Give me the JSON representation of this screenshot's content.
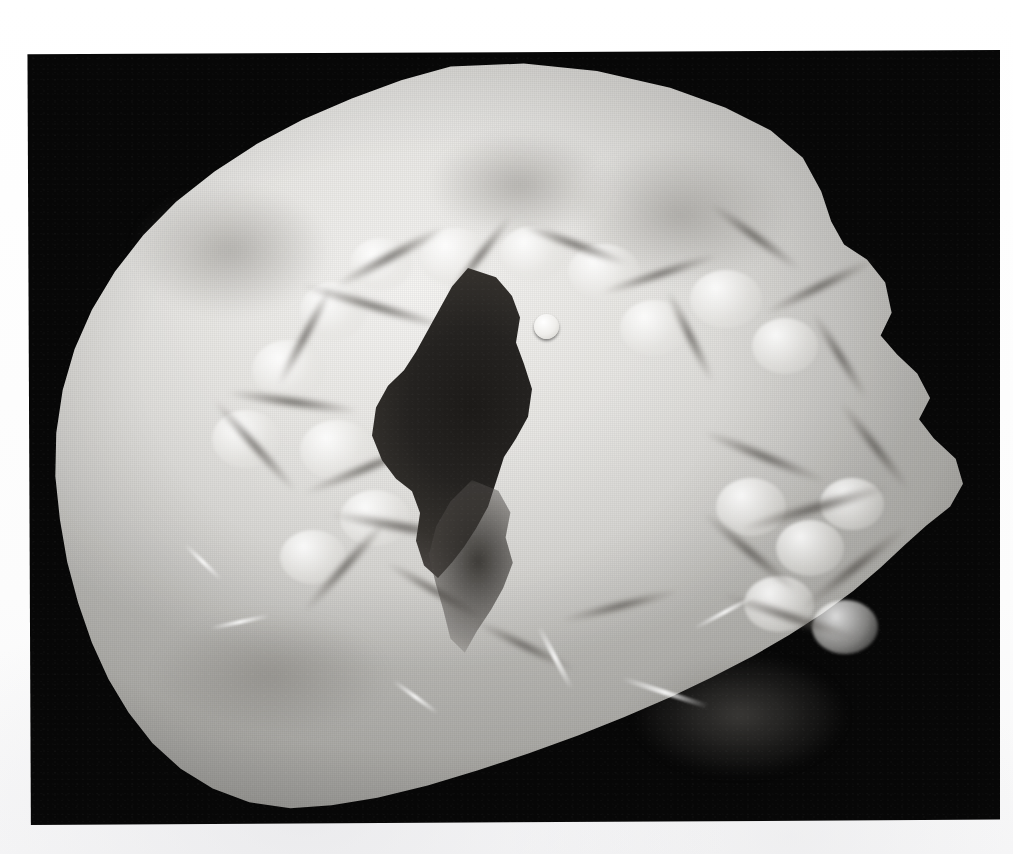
{
  "page": {
    "background_color": "#fdfdfd",
    "width": 1013,
    "height": 854,
    "caption": ""
  },
  "photograph": {
    "kind": "pathology-gross-specimen-photograph",
    "subject": "heart-ventricle-cross-section",
    "description": "Black and white gross pathology photograph of a transversely sectioned heart showing a thickened ventricular wall, prominent trabeculae carneae and a narrowed, slit-like dark ventricular cavity.",
    "plate": {
      "background_color": "#070707",
      "left": 26,
      "top": 50,
      "width": 974,
      "height": 775
    },
    "specimen": {
      "tone_light": "#f0efed",
      "tone_mid": "#d8d7d3",
      "tone_dark": "#bfbeba",
      "outline_shape": "irregular-rounded-blob"
    },
    "cavity": {
      "label": "ventricular-cavity",
      "tone": "#1c1a18",
      "left": 372,
      "top": 268,
      "width": 200,
      "height": 310
    },
    "nodule": {
      "label": "papillary-muscle-cut-surface",
      "tone": "#ffffff",
      "left": 534,
      "top": 314,
      "diameter": 25
    }
  },
  "clefts": [
    {
      "x": 330,
      "y": 250,
      "w": 120,
      "h": 14,
      "r": -28
    },
    {
      "x": 300,
      "y": 300,
      "w": 150,
      "h": 13,
      "r": 16
    },
    {
      "x": 250,
      "y": 330,
      "w": 110,
      "h": 12,
      "r": -62
    },
    {
      "x": 228,
      "y": 395,
      "w": 130,
      "h": 14,
      "r": 8
    },
    {
      "x": 195,
      "y": 440,
      "w": 120,
      "h": 12,
      "r": 48
    },
    {
      "x": 300,
      "y": 460,
      "w": 140,
      "h": 13,
      "r": -22
    },
    {
      "x": 330,
      "y": 520,
      "w": 150,
      "h": 15,
      "r": 10
    },
    {
      "x": 285,
      "y": 560,
      "w": 120,
      "h": 13,
      "r": -48
    },
    {
      "x": 380,
      "y": 585,
      "w": 110,
      "h": 12,
      "r": 30
    },
    {
      "x": 430,
      "y": 250,
      "w": 100,
      "h": 12,
      "r": -52
    },
    {
      "x": 520,
      "y": 238,
      "w": 110,
      "h": 13,
      "r": 20
    },
    {
      "x": 600,
      "y": 268,
      "w": 120,
      "h": 12,
      "r": -18
    },
    {
      "x": 640,
      "y": 330,
      "w": 100,
      "h": 12,
      "r": 64
    },
    {
      "x": 700,
      "y": 230,
      "w": 110,
      "h": 13,
      "r": 36
    },
    {
      "x": 760,
      "y": 280,
      "w": 120,
      "h": 13,
      "r": -26
    },
    {
      "x": 790,
      "y": 350,
      "w": 100,
      "h": 12,
      "r": 58
    },
    {
      "x": 700,
      "y": 450,
      "w": 130,
      "h": 14,
      "r": 22
    },
    {
      "x": 740,
      "y": 500,
      "w": 150,
      "h": 16,
      "r": -16
    },
    {
      "x": 690,
      "y": 545,
      "w": 120,
      "h": 14,
      "r": 40
    },
    {
      "x": 790,
      "y": 560,
      "w": 130,
      "h": 15,
      "r": -38
    },
    {
      "x": 720,
      "y": 610,
      "w": 140,
      "h": 14,
      "r": 18
    },
    {
      "x": 820,
      "y": 440,
      "w": 110,
      "h": 13,
      "r": 52
    },
    {
      "x": 560,
      "y": 600,
      "w": 120,
      "h": 12,
      "r": -14
    },
    {
      "x": 470,
      "y": 640,
      "w": 110,
      "h": 12,
      "r": 26
    }
  ],
  "nodes": [
    {
      "x": 350,
      "y": 238,
      "w": 62,
      "h": 52
    },
    {
      "x": 420,
      "y": 228,
      "w": 70,
      "h": 58
    },
    {
      "x": 500,
      "y": 226,
      "w": 66,
      "h": 54
    },
    {
      "x": 568,
      "y": 244,
      "w": 72,
      "h": 56
    },
    {
      "x": 300,
      "y": 282,
      "w": 66,
      "h": 58
    },
    {
      "x": 252,
      "y": 340,
      "w": 72,
      "h": 60
    },
    {
      "x": 212,
      "y": 410,
      "w": 68,
      "h": 58
    },
    {
      "x": 300,
      "y": 420,
      "w": 74,
      "h": 60
    },
    {
      "x": 340,
      "y": 490,
      "w": 70,
      "h": 56
    },
    {
      "x": 280,
      "y": 530,
      "w": 66,
      "h": 54
    },
    {
      "x": 620,
      "y": 300,
      "w": 68,
      "h": 56
    },
    {
      "x": 690,
      "y": 270,
      "w": 72,
      "h": 58
    },
    {
      "x": 752,
      "y": 318,
      "w": 66,
      "h": 56
    },
    {
      "x": 716,
      "y": 478,
      "w": 70,
      "h": 58
    },
    {
      "x": 776,
      "y": 520,
      "w": 68,
      "h": 56
    },
    {
      "x": 820,
      "y": 478,
      "w": 64,
      "h": 52
    },
    {
      "x": 744,
      "y": 576,
      "w": 70,
      "h": 56
    },
    {
      "x": 812,
      "y": 600,
      "w": 66,
      "h": 54
    }
  ],
  "highlights": [
    {
      "x": 520,
      "y": 655,
      "w": 70,
      "h": 5,
      "r": 62
    },
    {
      "x": 210,
      "y": 620,
      "w": 60,
      "h": 4,
      "r": -12
    },
    {
      "x": 620,
      "y": 690,
      "w": 90,
      "h": 5,
      "r": 18
    },
    {
      "x": 388,
      "y": 695,
      "w": 55,
      "h": 4,
      "r": 36
    },
    {
      "x": 690,
      "y": 610,
      "w": 70,
      "h": 4,
      "r": -28
    },
    {
      "x": 178,
      "y": 560,
      "w": 50,
      "h": 4,
      "r": 44
    }
  ],
  "shades": [
    {
      "x": 120,
      "y": 170,
      "w": 220,
      "h": 160
    },
    {
      "x": 560,
      "y": 130,
      "w": 240,
      "h": 170
    },
    {
      "x": 140,
      "y": 600,
      "w": 260,
      "h": 150
    },
    {
      "x": 620,
      "y": 640,
      "w": 240,
      "h": 150
    },
    {
      "x": 420,
      "y": 120,
      "w": 200,
      "h": 130
    }
  ]
}
